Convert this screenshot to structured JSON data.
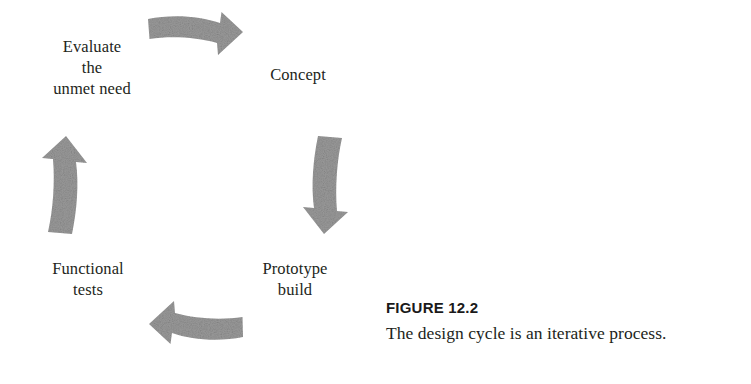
{
  "figure": {
    "caption_title": "FIGURE 12.2",
    "caption_text": "The design cycle is an iterative process.",
    "arrow_color": "#9a9a9a",
    "text_color": "#231f20",
    "background_color": "#ffffff"
  },
  "cycle": {
    "stages": [
      {
        "id": "evaluate",
        "lines": [
          "Evaluate",
          "the",
          "unmet need"
        ],
        "position": "top-left"
      },
      {
        "id": "concept",
        "lines": [
          "Concept"
        ],
        "position": "top-right"
      },
      {
        "id": "prototype",
        "lines": [
          "Prototype",
          "build"
        ],
        "position": "bottom-right"
      },
      {
        "id": "functional",
        "lines": [
          "Functional",
          "tests"
        ],
        "position": "bottom-left"
      }
    ],
    "arrows": [
      {
        "id": "top",
        "direction": "right",
        "from": "evaluate",
        "to": "concept"
      },
      {
        "id": "right",
        "direction": "down",
        "from": "concept",
        "to": "prototype"
      },
      {
        "id": "bottom",
        "direction": "left",
        "from": "prototype",
        "to": "functional"
      },
      {
        "id": "left",
        "direction": "up",
        "from": "functional",
        "to": "evaluate"
      }
    ]
  }
}
